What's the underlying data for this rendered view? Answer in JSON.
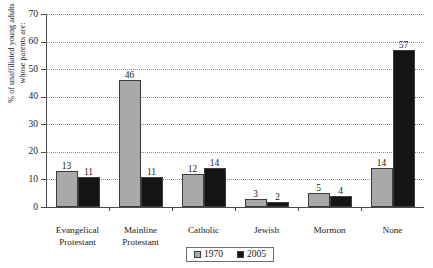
{
  "chart_data": {
    "type": "bar",
    "title": "",
    "xlabel": "",
    "ylabel": "% of unaffiliated young adults whose parents are:",
    "ylabel_lines": [
      "% of unaffiliated young adults",
      "whose parents are:"
    ],
    "ylim": [
      0,
      70
    ],
    "ytick_step": 10,
    "ytick_labels": [
      "0",
      "10",
      "20",
      "30",
      "40",
      "50",
      "60",
      "70"
    ],
    "grid": true,
    "grid_style": "dotted-horizontal",
    "legend_position": "bottom-center",
    "categories": [
      "Evangelical Protestant",
      "Mainline Protestant",
      "Catholic",
      "Jewish",
      "Mormon",
      "None"
    ],
    "category_label_lines": [
      [
        "Evangelical",
        "Protestant"
      ],
      [
        "Mainline",
        "Protestant"
      ],
      [
        "Catholic"
      ],
      [
        "Jewish"
      ],
      [
        "Mormon"
      ],
      [
        "None"
      ]
    ],
    "series": [
      {
        "name": "1970",
        "color": "#a9a9a9",
        "values": [
          13,
          46,
          12,
          3,
          5,
          14
        ],
        "labels": [
          "13",
          "46",
          "12",
          "3",
          "5",
          "14"
        ]
      },
      {
        "name": "2005",
        "color": "#141414",
        "values": [
          11,
          11,
          14,
          2,
          4,
          57
        ],
        "labels": [
          "11",
          "11",
          "14",
          "2",
          "4",
          "57"
        ]
      }
    ]
  },
  "legend": {
    "items": [
      {
        "label": "1970",
        "color": "#a9a9a9"
      },
      {
        "label": "2005",
        "color": "#141414"
      }
    ]
  }
}
